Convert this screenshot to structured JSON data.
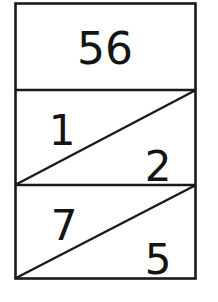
{
  "figure": {
    "name": "divided-rectangle-number-figure",
    "stroke_color": "#1a1a1a",
    "fill_color": "#ffffff",
    "text_color": "#141414",
    "rows": [
      {
        "id": "row-top",
        "split": "none",
        "labels": [
          {
            "id": "label-56",
            "text": "56",
            "position": "center"
          }
        ]
      },
      {
        "id": "row-middle",
        "split": "diagonal-bottomleft-to-topright",
        "labels": [
          {
            "id": "label-1",
            "text": "1",
            "position": "upper-left"
          },
          {
            "id": "label-2",
            "text": "2",
            "position": "lower-right"
          }
        ]
      },
      {
        "id": "row-bottom",
        "split": "diagonal-bottomleft-to-topright",
        "labels": [
          {
            "id": "label-7",
            "text": "7",
            "position": "upper-left"
          },
          {
            "id": "label-5",
            "text": "5",
            "position": "lower-right"
          }
        ]
      }
    ]
  }
}
